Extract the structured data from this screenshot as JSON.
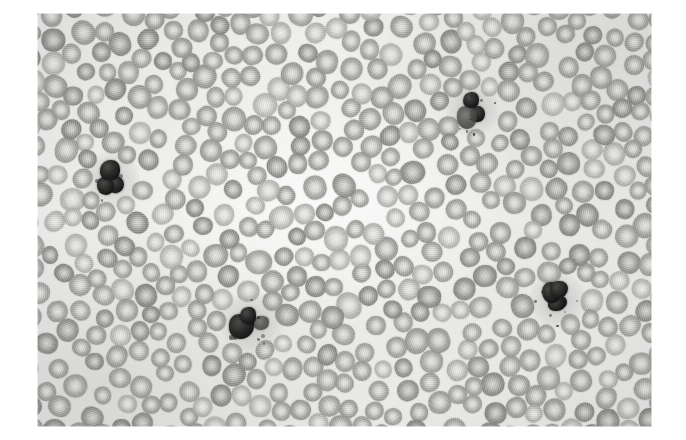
{
  "figure": {
    "kind": "photomicrograph",
    "modality": "brightfield light microscopy",
    "stain_appearance": "grayscale / monochrome",
    "caption": "",
    "title": ""
  },
  "plate": {
    "left": 37,
    "top": 13,
    "width": 615,
    "height": 414,
    "page_background": "#ffffff",
    "field_background": "#ececea",
    "erythrocyte_fill": "#9a9a97",
    "erythrocyte_pallor": "#e6e6e4",
    "leukocyte_nucleus": "#141414"
  },
  "content": {
    "erythrocyte_count_visible": 540,
    "leukocyte_count_visible": 4,
    "mean_erythrocyte_diameter_px": 21
  },
  "chart_data": {
    "type": "scatter",
    "xlabel": "",
    "ylabel": "",
    "xlim": [
      0,
      615
    ],
    "ylim": [
      0,
      414
    ],
    "grid": false,
    "legend": "none",
    "series": [
      {
        "name": "leukocytes",
        "color": "#141414",
        "points": [
          {
            "x": 74,
            "y": 166,
            "d": 30,
            "label": "leukocyte-1"
          },
          {
            "x": 435,
            "y": 97,
            "d": 28,
            "label": "leukocyte-2"
          },
          {
            "x": 215,
            "y": 310,
            "d": 34,
            "label": "leukocyte-3"
          },
          {
            "x": 520,
            "y": 287,
            "d": 30,
            "label": "leukocyte-4"
          }
        ]
      }
    ]
  }
}
